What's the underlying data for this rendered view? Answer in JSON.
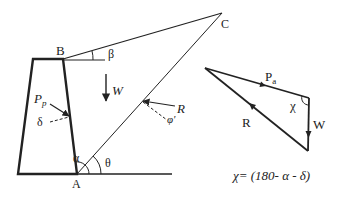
{
  "diagram": {
    "type": "retaining-wall-passive-pressure-force-polygon",
    "points": {
      "A": "A",
      "B": "B",
      "C": "C"
    },
    "wall_labels": {
      "passive_force": "P",
      "passive_force_sub": "p",
      "wall_friction": "δ",
      "wall_angle": "α",
      "failure_angle": "θ",
      "backfill_slope": "β",
      "weight": "W",
      "reaction": "R",
      "soil_friction": "φ'"
    },
    "force_triangle": {
      "pa_label": "P",
      "pa_sub": "a",
      "reaction_label": "R",
      "weight_label": "W",
      "angle_label": "χ"
    },
    "equation": "χ= (180- α - δ)"
  },
  "colors": {
    "stroke": "#222222",
    "background": "#ffffff"
  }
}
